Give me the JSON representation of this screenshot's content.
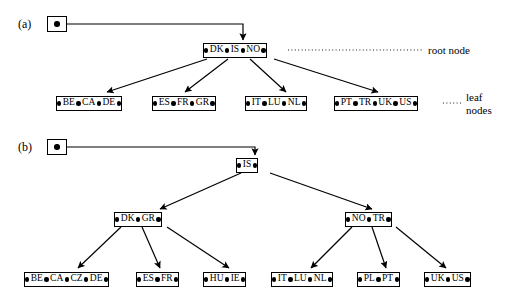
{
  "figure": {
    "panels": [
      {
        "id": "a",
        "label": "(a)"
      },
      {
        "id": "b",
        "label": "(b)"
      }
    ],
    "annotations": [
      {
        "id": "root-node",
        "text": "root node"
      },
      {
        "id": "leaf-nodes",
        "text": "leaf\nnodes"
      }
    ],
    "colors": {
      "ink": "#000000",
      "paper": "#ffffff"
    }
  },
  "panel_a": {
    "start": {
      "name": "start-pointer"
    },
    "root": {
      "keys": [
        "DK",
        "IS",
        "NO"
      ]
    },
    "leaves": [
      {
        "keys": [
          "BE",
          "CA",
          "DE"
        ]
      },
      {
        "keys": [
          "ES",
          "FR",
          "GR"
        ]
      },
      {
        "keys": [
          "IT",
          "LU",
          "NL"
        ]
      },
      {
        "keys": [
          "PT",
          "TR",
          "UK",
          "US"
        ]
      }
    ]
  },
  "panel_b": {
    "start": {
      "name": "start-pointer"
    },
    "root": {
      "keys": [
        "IS"
      ]
    },
    "internal": [
      {
        "keys": [
          "DK",
          "GR"
        ]
      },
      {
        "keys": [
          "NO",
          "TR"
        ]
      }
    ],
    "leaves": [
      {
        "keys": [
          "BE",
          "CA",
          "CZ",
          "DE"
        ]
      },
      {
        "keys": [
          "ES",
          "FR"
        ]
      },
      {
        "keys": [
          "HU",
          "IE"
        ]
      },
      {
        "keys": [
          "IT",
          "LU",
          "NL"
        ]
      },
      {
        "keys": [
          "PL",
          "PT"
        ]
      },
      {
        "keys": [
          "UK",
          "US"
        ]
      }
    ]
  }
}
